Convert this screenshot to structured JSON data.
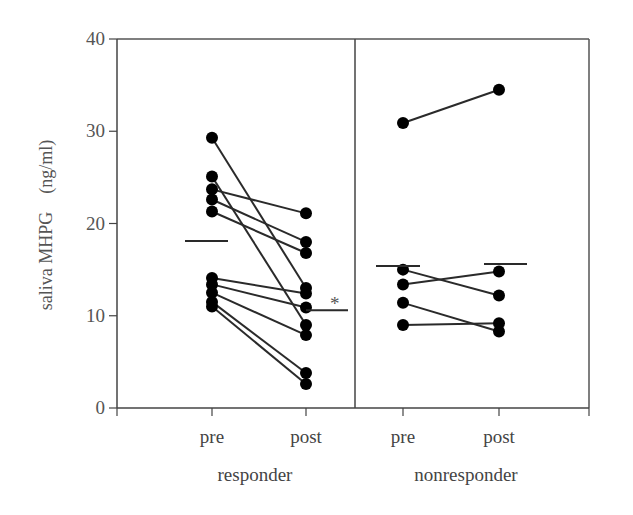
{
  "chart_data": {
    "type": "scatter",
    "subtype": "paired-line (pre/post) with group means",
    "title": "",
    "ylabel": "saliva MHPG (ng/ml)",
    "xlabel": "",
    "ylim": [
      0,
      40
    ],
    "yticks": [
      0,
      10,
      20,
      30,
      40
    ],
    "grid": false,
    "legend": null,
    "groups": [
      {
        "name": "responder",
        "categories": [
          "pre",
          "post"
        ],
        "pairs": [
          {
            "pre": 29.3,
            "post": 13.0
          },
          {
            "pre": 25.1,
            "post": 9.0
          },
          {
            "pre": 23.7,
            "post": 21.1
          },
          {
            "pre": 22.6,
            "post": 18.0
          },
          {
            "pre": 21.3,
            "post": 16.8
          },
          {
            "pre": 14.1,
            "post": 12.4
          },
          {
            "pre": 13.4,
            "post": 10.9
          },
          {
            "pre": 12.5,
            "post": 7.9
          },
          {
            "pre": 11.5,
            "post": 3.8
          },
          {
            "pre": 11.0,
            "post": 2.6
          }
        ],
        "mean": {
          "pre": 18.1,
          "post": 10.6
        },
        "annotation": "*"
      },
      {
        "name": "nonresponder",
        "categories": [
          "pre",
          "post"
        ],
        "pairs": [
          {
            "pre": 30.9,
            "post": 34.5
          },
          {
            "pre": 15.0,
            "post": 12.2
          },
          {
            "pre": 13.4,
            "post": 14.8
          },
          {
            "pre": 11.4,
            "post": 8.3
          },
          {
            "pre": 9.0,
            "post": 9.2
          }
        ],
        "mean": {
          "pre": 15.4,
          "post": 15.6
        }
      }
    ],
    "annotations": [
      {
        "text": "*",
        "near": "responder post mean",
        "meaning": "significant difference"
      }
    ]
  },
  "labels": {
    "ylabel": "saliva MHPG　(ng/ml)",
    "yticks": [
      "0",
      "10",
      "20",
      "30",
      "40"
    ],
    "categories": [
      "pre",
      "post",
      "pre",
      "post"
    ],
    "groups": [
      "responder",
      "nonresponder"
    ],
    "asterisk": "*"
  }
}
